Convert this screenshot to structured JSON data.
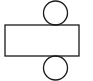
{
  "diagram": {
    "type": "cylinder-net",
    "stroke_color": "#1a1a1a",
    "background": "#ffffff",
    "shapes": {
      "top_circle": {
        "cx": 55.5,
        "cy": 13,
        "r": 12
      },
      "rectangle": {
        "x": 5,
        "y": 25,
        "width": 74,
        "height": 31
      },
      "bottom_circle": {
        "cx": 55.5,
        "cy": 68,
        "r": 12
      }
    }
  }
}
